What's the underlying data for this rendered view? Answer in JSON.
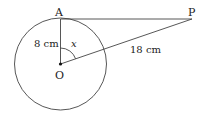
{
  "diagram": {
    "points": {
      "A": {
        "label": "A"
      },
      "P": {
        "label": "P"
      },
      "O": {
        "label": "O"
      }
    },
    "labels": {
      "radius": "8 cm",
      "op_length": "18 cm",
      "angle": "x"
    },
    "colors": {
      "stroke": "#333333",
      "text": "#222222",
      "background": "#ffffff"
    }
  }
}
